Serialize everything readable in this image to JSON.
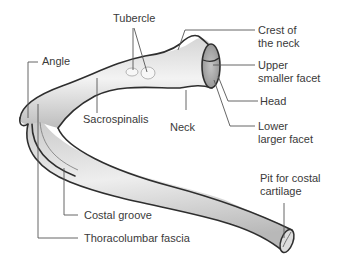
{
  "diagram": {
    "colors": {
      "bone_light": "#f2f2f2",
      "bone_mid": "#d2d2d2",
      "bone_dark": "#a9a9a9",
      "outline": "#2e2e2e",
      "leader": "#555555",
      "text": "#3a3a3a"
    },
    "labels": {
      "tubercle": "Tubercle",
      "crest_line1": "Crest of",
      "crest_line2": "the neck",
      "angle": "Angle",
      "upper_facet_line1": "Upper",
      "upper_facet_line2": "smaller facet",
      "sacrospinalis": "Sacrospinalis",
      "neck": "Neck",
      "head": "Head",
      "lower_facet_line1": "Lower",
      "lower_facet_line2": "larger facet",
      "pit_line1": "Pit for costal",
      "pit_line2": "cartilage",
      "costal_groove": "Costal groove",
      "thoracolumbar": "Thoracolumbar fascia"
    }
  }
}
